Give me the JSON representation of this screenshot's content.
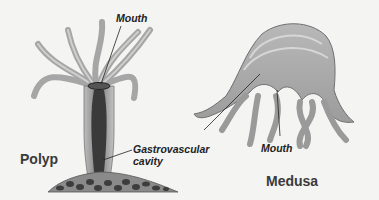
{
  "figure": {
    "polyp": {
      "title": "Polyp",
      "labels": {
        "mouth": "Mouth",
        "gastrovascular_line1": "Gastrovascular",
        "gastrovascular_line2": "cavity"
      }
    },
    "medusa": {
      "title": "Medusa",
      "labels": {
        "mouth": "Mouth"
      }
    },
    "colors": {
      "background": "#f4f4f2",
      "body_fill": "#a9a9a9",
      "body_light": "#cfcfcf",
      "cavity_dark": "#3a3a3a",
      "rock_fill": "#8a8a8a",
      "rock_spots": "#3d3d3d",
      "leader_line": "#222222"
    }
  }
}
